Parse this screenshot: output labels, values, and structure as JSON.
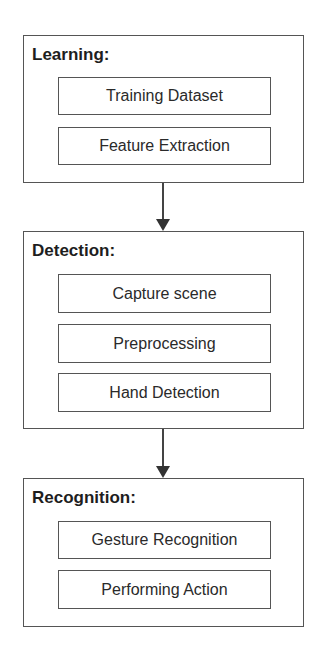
{
  "stages": [
    {
      "title": "Learning:",
      "steps": [
        "Training Dataset",
        "Feature Extraction"
      ]
    },
    {
      "title": "Detection:",
      "steps": [
        "Capture scene",
        "Preprocessing",
        "Hand Detection"
      ]
    },
    {
      "title": "Recognition:",
      "steps": [
        "Gesture Recognition",
        "Performing Action"
      ]
    }
  ],
  "connectors": [
    {
      "from": "Learning",
      "to": "Detection",
      "icon": "arrow-down-icon"
    },
    {
      "from": "Detection",
      "to": "Recognition",
      "icon": "arrow-down-icon"
    }
  ],
  "colors": {
    "stroke": "#555555",
    "text": "#2a2a2a",
    "background": "#ffffff"
  }
}
